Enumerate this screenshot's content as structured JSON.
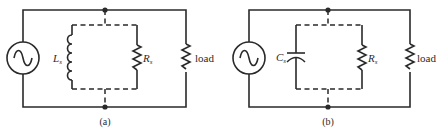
{
  "figure": {
    "circuits": [
      {
        "id": "a",
        "caption": "(a)",
        "source": "ac-source",
        "reactive_component": {
          "type": "inductor",
          "label_main": "L",
          "label_sub": "s"
        },
        "shunt_resistor": {
          "label_main": "R",
          "label_sub": "s"
        },
        "load_label": "load"
      },
      {
        "id": "b",
        "caption": "(b)",
        "source": "ac-source",
        "reactive_component": {
          "type": "capacitor",
          "label_main": "C",
          "label_sub": "s"
        },
        "shunt_resistor": {
          "label_main": "R",
          "label_sub": "s"
        },
        "load_label": "load"
      }
    ]
  }
}
